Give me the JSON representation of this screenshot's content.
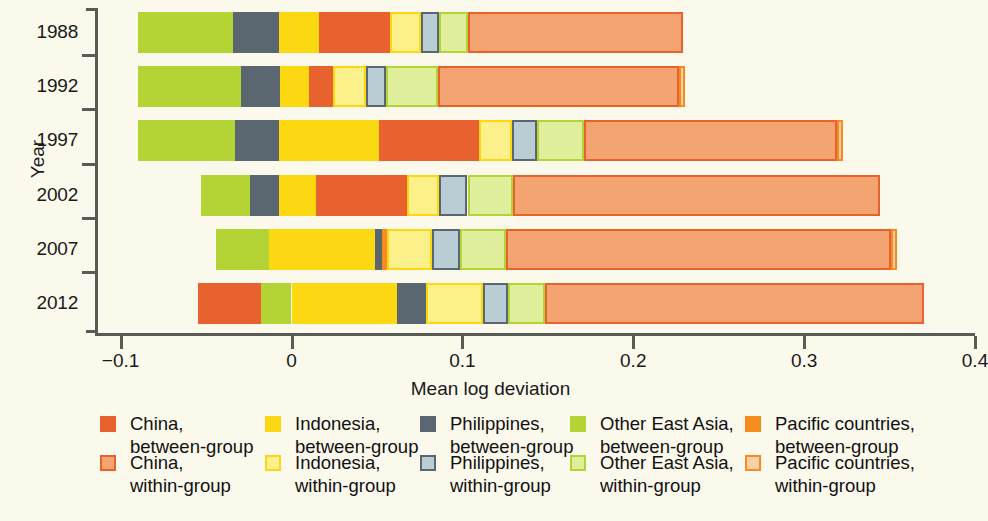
{
  "chart_data": {
    "type": "bar",
    "orientation": "horizontal",
    "stacked": true,
    "title": "",
    "xlabel": "Mean log deviation",
    "ylabel": "Year",
    "xlim": [
      -0.115,
      0.4
    ],
    "xticks": [
      -0.1,
      0,
      0.1,
      0.2,
      0.3,
      0.4
    ],
    "xticklabels": [
      "−0.1",
      "0",
      "0.1",
      "0.2",
      "0.3",
      "0.4"
    ],
    "grid": false,
    "legend_position": "bottom",
    "categories": [
      "1988",
      "1992",
      "1997",
      "2002",
      "2007",
      "2012"
    ],
    "series": [
      {
        "name": "China, between-group",
        "color": "#e8622f",
        "border": "#e8622f",
        "values": [
          0.0415,
          0.014,
          0.0585,
          0.0535,
          0.0029,
          -0.043
        ]
      },
      {
        "name": "Indonesia, between-group",
        "color": "#fbd812",
        "border": "#fbd812",
        "values": [
          0.0235,
          0.0165,
          0.0588,
          0.0218,
          0.0618,
          0.0618
        ]
      },
      {
        "name": "Philippines, between-group",
        "color": "#5a6670",
        "border": "#5a6670",
        "values": [
          0.0265,
          0.0229,
          0.0253,
          0.0165,
          0.0041,
          0.0171
        ]
      },
      {
        "name": "Other East Asia, between-group",
        "color": "#b4d335",
        "border": "#b4d335",
        "values": [
          0.0559,
          0.0606,
          0.0571,
          0.0288,
          0.0312,
          0.0176
        ]
      },
      {
        "name": "Pacific countries, between-group",
        "color": "#f68b1f",
        "border": "#f68b1f",
        "values": [
          0.0,
          0.0,
          0.0,
          0.0,
          0.0029,
          0.0
        ]
      },
      {
        "name": "China, within-group",
        "color": "#f4a471",
        "border": "#e8622f",
        "values": [
          0.1259,
          0.1412,
          0.1482,
          0.2147,
          0.2253,
          0.2218
        ]
      },
      {
        "name": "Indonesia, within-group",
        "color": "#fcf08a",
        "border": "#fbd812",
        "values": [
          0.0182,
          0.0194,
          0.0194,
          0.0188,
          0.0265,
          0.0329
        ]
      },
      {
        "name": "Philippines, within-group",
        "color": "#bbcdd4",
        "border": "#5a6670",
        "values": [
          0.0106,
          0.0118,
          0.0147,
          0.0165,
          0.0165,
          0.0147
        ]
      },
      {
        "name": "Other East Asia, within-group",
        "color": "#e0ef9b",
        "border": "#b4d335",
        "values": [
          0.0171,
          0.0306,
          0.0271,
          0.0265,
          0.0265,
          0.0218
        ]
      },
      {
        "name": "Pacific countries, within-group",
        "color": "#f9cfa5",
        "border": "#f68b1f",
        "values": [
          0.0,
          0.0035,
          0.0035,
          0.0,
          0.0035,
          0.0
        ]
      }
    ],
    "stack_order": [
      "Other East Asia, between-group",
      "Philippines, between-group",
      "Indonesia, between-group",
      "China, between-group",
      "Pacific countries, between-group",
      "Indonesia, within-group",
      "Philippines, within-group",
      "Other East Asia, within-group",
      "China, within-group",
      "Pacific countries, within-group"
    ],
    "bar_segments": {
      "1988": [
        {
          "series": "Other East Asia, between-group",
          "start": -0.09,
          "end": -0.0341
        },
        {
          "series": "Philippines, between-group",
          "start": -0.0341,
          "end": -0.0076
        },
        {
          "series": "Indonesia, between-group",
          "start": -0.0076,
          "end": 0.0159
        },
        {
          "series": "China, between-group",
          "start": 0.0159,
          "end": 0.0574
        },
        {
          "series": "Indonesia, within-group",
          "start": 0.0574,
          "end": 0.0756
        },
        {
          "series": "Philippines, within-group",
          "start": 0.0756,
          "end": 0.0862
        },
        {
          "series": "Other East Asia, within-group",
          "start": 0.0862,
          "end": 0.1033
        },
        {
          "series": "China, within-group",
          "start": 0.1033,
          "end": 0.2292
        }
      ],
      "1992": [
        {
          "series": "Other East Asia, between-group",
          "start": -0.09,
          "end": -0.0294
        },
        {
          "series": "Philippines, between-group",
          "start": -0.0294,
          "end": -0.0065
        },
        {
          "series": "Indonesia, between-group",
          "start": -0.0065,
          "end": 0.01
        },
        {
          "series": "China, between-group",
          "start": 0.01,
          "end": 0.024
        },
        {
          "series": "Indonesia, within-group",
          "start": 0.024,
          "end": 0.0434
        },
        {
          "series": "Philippines, within-group",
          "start": 0.0434,
          "end": 0.0552
        },
        {
          "series": "Other East Asia, within-group",
          "start": 0.0552,
          "end": 0.0858
        },
        {
          "series": "China, within-group",
          "start": 0.0858,
          "end": 0.227
        },
        {
          "series": "Pacific countries, within-group",
          "start": 0.227,
          "end": 0.2305
        }
      ],
      "1997": [
        {
          "series": "Other East Asia, between-group",
          "start": -0.09,
          "end": -0.0329
        },
        {
          "series": "Philippines, between-group",
          "start": -0.0329,
          "end": -0.0076
        },
        {
          "series": "Indonesia, between-group",
          "start": -0.0076,
          "end": 0.0512
        },
        {
          "series": "China, between-group",
          "start": 0.0512,
          "end": 0.1097
        },
        {
          "series": "Indonesia, within-group",
          "start": 0.1097,
          "end": 0.1291
        },
        {
          "series": "Philippines, within-group",
          "start": 0.1291,
          "end": 0.1438
        },
        {
          "series": "Other East Asia, within-group",
          "start": 0.1438,
          "end": 0.1709
        },
        {
          "series": "China, within-group",
          "start": 0.1709,
          "end": 0.3191
        },
        {
          "series": "Pacific countries, within-group",
          "start": 0.3191,
          "end": 0.3226
        }
      ],
      "2002": [
        {
          "series": "Other East Asia, between-group",
          "start": -0.0529,
          "end": -0.0241
        },
        {
          "series": "Philippines, between-group",
          "start": -0.0241,
          "end": -0.0076
        },
        {
          "series": "Indonesia, between-group",
          "start": -0.0076,
          "end": 0.0142
        },
        {
          "series": "China, between-group",
          "start": 0.0142,
          "end": 0.0677
        },
        {
          "series": "Indonesia, within-group",
          "start": 0.0677,
          "end": 0.0865
        },
        {
          "series": "Philippines, within-group",
          "start": 0.0865,
          "end": 0.103
        },
        {
          "series": "Other East Asia, within-group",
          "start": 0.103,
          "end": 0.1295
        },
        {
          "series": "China, within-group",
          "start": 0.1295,
          "end": 0.3442
        }
      ],
      "2007": [
        {
          "series": "Other East Asia, between-group",
          "start": -0.0441,
          "end": -0.0129
        },
        {
          "series": "Indonesia, between-group",
          "start": -0.0129,
          "end": 0.0489
        },
        {
          "series": "Philippines, between-group",
          "start": 0.0489,
          "end": 0.053
        },
        {
          "series": "Pacific countries, between-group",
          "start": 0.053,
          "end": 0.0559
        },
        {
          "series": "Indonesia, within-group",
          "start": 0.0559,
          "end": 0.0824
        },
        {
          "series": "Philippines, within-group",
          "start": 0.0824,
          "end": 0.0989
        },
        {
          "series": "Other East Asia, within-group",
          "start": 0.0989,
          "end": 0.1254
        },
        {
          "series": "China, within-group",
          "start": 0.1254,
          "end": 0.3507
        },
        {
          "series": "Pacific countries, within-group",
          "start": 0.3507,
          "end": 0.3542
        }
      ],
      "2012": [
        {
          "series": "China, between-group",
          "start": -0.0547,
          "end": -0.0176
        },
        {
          "series": "Other East Asia, between-group",
          "start": -0.0176,
          "end": 0.0
        },
        {
          "series": "Indonesia, between-group",
          "start": 0.0,
          "end": 0.0618
        },
        {
          "series": "Philippines, between-group",
          "start": 0.0618,
          "end": 0.0789
        },
        {
          "series": "Indonesia, within-group",
          "start": 0.0789,
          "end": 0.1118
        },
        {
          "series": "Philippines, within-group",
          "start": 0.1118,
          "end": 0.1265
        },
        {
          "series": "Other East Asia, within-group",
          "start": 0.1265,
          "end": 0.1483
        },
        {
          "series": "China, within-group",
          "start": 0.1483,
          "end": 0.3701
        }
      ]
    }
  },
  "legend": {
    "columns": [
      {
        "between": {
          "label_line1": "China,",
          "label_line2": "between-group",
          "color": "#e8622f",
          "border": "#e8622f"
        },
        "within": {
          "label_line1": "China,",
          "label_line2": "within-group",
          "color": "#f4a471",
          "border": "#e8622f"
        }
      },
      {
        "between": {
          "label_line1": "Indonesia,",
          "label_line2": "between-group",
          "color": "#fbd812",
          "border": "#fbd812"
        },
        "within": {
          "label_line1": "Indonesia,",
          "label_line2": "within-group",
          "color": "#fcf08a",
          "border": "#fbd812"
        }
      },
      {
        "between": {
          "label_line1": "Philippines,",
          "label_line2": "between-group",
          "color": "#5a6670",
          "border": "#5a6670"
        },
        "within": {
          "label_line1": "Philippines,",
          "label_line2": "within-group",
          "color": "#bbcdd4",
          "border": "#5a6670"
        }
      },
      {
        "between": {
          "label_line1": "Other East Asia,",
          "label_line2": "between-group",
          "color": "#b4d335",
          "border": "#b4d335"
        },
        "within": {
          "label_line1": "Other East Asia,",
          "label_line2": "within-group",
          "color": "#e0ef9b",
          "border": "#b4d335"
        }
      },
      {
        "between": {
          "label_line1": "Pacific countries,",
          "label_line2": "between-group",
          "color": "#f68b1f",
          "border": "#f68b1f"
        },
        "within": {
          "label_line1": "Pacific countries,",
          "label_line2": "within-group",
          "color": "#f9cfa5",
          "border": "#f68b1f"
        }
      }
    ],
    "column_x": [
      100,
      265,
      420,
      570,
      745
    ],
    "row_y": [
      8,
      47
    ]
  },
  "theme": {
    "background": "#fbf8ec",
    "axis_color": "#595b56",
    "text_color": "#1a1a1a"
  }
}
